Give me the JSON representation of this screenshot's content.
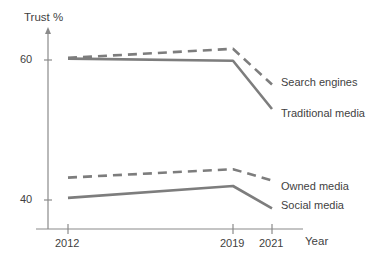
{
  "chart_data": {
    "type": "line",
    "title": "",
    "xlabel": "Year",
    "ylabel": "Trust %",
    "categories": [
      "2012",
      "2019",
      "2021"
    ],
    "x": [
      2012,
      2019,
      2021
    ],
    "xlim": [
      2010.2,
      2022.2
    ],
    "ylim": [
      36.5,
      64.5
    ],
    "yticks": [
      40,
      60
    ],
    "ytick_labels": [
      "40",
      "60"
    ],
    "xtick_labels": [
      "2012",
      "2019",
      "2021"
    ],
    "grid": false,
    "legend_position": "right-inline-labels",
    "series": [
      {
        "name": "Search engines",
        "style": "dashed",
        "color": "#7d7d7d",
        "values": [
          60.3,
          61.6,
          56.5
        ]
      },
      {
        "name": "Traditional media",
        "style": "solid",
        "color": "#7d7d7d",
        "values": [
          60.2,
          59.9,
          53.0
        ]
      },
      {
        "name": "Owned media",
        "style": "dashed",
        "color": "#7d7d7d",
        "values": [
          43.2,
          44.4,
          42.8
        ]
      },
      {
        "name": "Social media",
        "style": "solid",
        "color": "#7d7d7d",
        "values": [
          40.3,
          42.0,
          38.8
        ]
      }
    ]
  },
  "axes": {
    "y_title": "Trust %",
    "x_title": "Year",
    "y_tick_60": "60",
    "y_tick_40": "40",
    "x_tick_2012": "2012",
    "x_tick_2019": "2019",
    "x_tick_2021": "2021"
  },
  "series_labels": {
    "search_engines": "Search engines",
    "traditional_media": "Traditional media",
    "owned_media": "Owned media",
    "social_media": "Social media"
  },
  "colors": {
    "line": "#7d7d7d",
    "axis": "#8a8a8a",
    "text": "#3f3f3f",
    "background": "#ffffff"
  }
}
